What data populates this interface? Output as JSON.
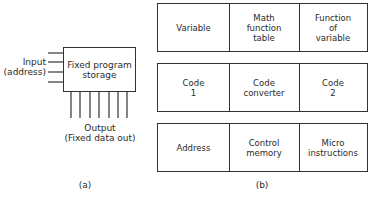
{
  "diagram_a": {
    "box_label": "Fixed program\nstorage",
    "input_label": "Input\n(address)",
    "output_label": "Output\n(Fixed data out)",
    "input_lines": 4,
    "output_lines": 7,
    "caption": "(a)"
  },
  "diagram_b": {
    "rows": [
      {
        "cells": [
          "Variable",
          "Math\nfunction\ntable",
          "Function\nof\nvariable"
        ]
      },
      {
        "cells": [
          "Code\n1",
          "Code\nconverter",
          "Code\n2"
        ]
      },
      {
        "cells": [
          "Address",
          "Control\nmemory",
          "Micro\ninstructions"
        ]
      }
    ],
    "caption": "(b)"
  },
  "colors": {
    "line": "#333333",
    "text": "#2a2a2a",
    "background": "#ffffff"
  }
}
